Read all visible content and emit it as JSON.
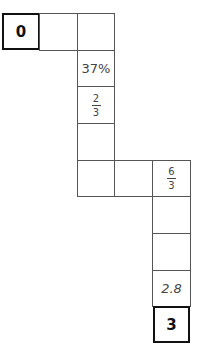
{
  "puzzle": {
    "start": "0",
    "end": "3",
    "cells": {
      "c1": "",
      "c2": "",
      "c3": "37%",
      "c4": {
        "num": "2",
        "den": "3"
      },
      "c5": "",
      "c6": "",
      "c7": "",
      "c8": {
        "num": "6",
        "den": "3"
      },
      "c9": "",
      "c10": "",
      "c11": "2.8"
    }
  }
}
